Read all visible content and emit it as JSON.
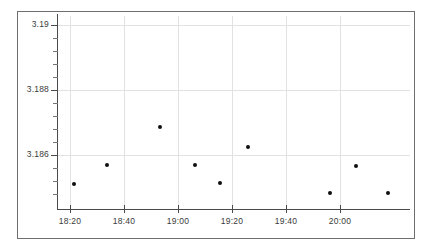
{
  "chart_data": {
    "type": "scatter",
    "title": "",
    "subtitle": "",
    "xlabel": "",
    "ylabel": "",
    "x_tick_labels": [
      "18:20",
      "18:40",
      "19:00",
      "19:20",
      "19:40",
      "20:00"
    ],
    "y_tick_labels": [
      "3.19",
      "3.188",
      "3.186"
    ],
    "y_tick_values": [
      3.19,
      3.188,
      3.186
    ],
    "xlim": [
      "18:15",
      "20:22"
    ],
    "ylim": [
      3.1845,
      3.1903
    ],
    "grid": "both",
    "legend": "none",
    "minor_y_ticks": 4,
    "marker": "filled-circle",
    "marker_color": "#101010",
    "grid_color": "#e2e2e2",
    "axis_color": "#4a4a4a",
    "frame_color": "#6f6f6f",
    "background": "#ffffff",
    "points": [
      {
        "x": "18:21",
        "y": 3.1851
      },
      {
        "x": "18:34",
        "y": 3.18568
      },
      {
        "x": "18:53",
        "y": 3.18685
      },
      {
        "x": "19:06",
        "y": 3.18568
      },
      {
        "x": "19:15",
        "y": 3.18513
      },
      {
        "x": "19:26",
        "y": 3.18624
      },
      {
        "x": "19:56",
        "y": 3.18483
      },
      {
        "x": "20:05",
        "y": 3.18566
      },
      {
        "x": "20:17",
        "y": 3.18483
      }
    ]
  },
  "geometry": {
    "x_tick_px": [
      70,
      124,
      178,
      232,
      286,
      340
    ],
    "y_tick_px": [
      25,
      90,
      155
    ],
    "y_minor_px": [
      38,
      51,
      64,
      77,
      103,
      116,
      129,
      142,
      168,
      181,
      194
    ],
    "point_px": [
      {
        "cx": 74,
        "cy": 184
      },
      {
        "cx": 107,
        "cy": 165
      },
      {
        "cx": 160,
        "cy": 127
      },
      {
        "cx": 195,
        "cy": 165
      },
      {
        "cx": 220,
        "cy": 183
      },
      {
        "cx": 248,
        "cy": 147
      },
      {
        "cx": 330,
        "cy": 193
      },
      {
        "cx": 356,
        "cy": 166
      },
      {
        "cx": 388,
        "cy": 193
      }
    ]
  }
}
